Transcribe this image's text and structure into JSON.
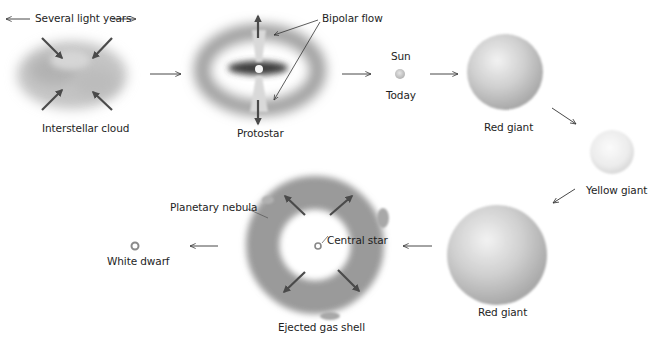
{
  "diagram": {
    "scale_label": "Several light years",
    "stages": [
      {
        "id": "interstellar-cloud",
        "label": "Interstellar cloud"
      },
      {
        "id": "protostar",
        "label": "Protostar",
        "annotation": "Bipolar flow"
      },
      {
        "id": "sun",
        "label_top": "Sun",
        "label_bottom": "Today"
      },
      {
        "id": "red-giant-1",
        "label": "Red giant"
      },
      {
        "id": "yellow-giant",
        "label": "Yellow giant"
      },
      {
        "id": "red-giant-2",
        "label": "Red giant"
      },
      {
        "id": "planetary-nebula",
        "label": "Ejected gas shell",
        "annotations": [
          "Planetary nebula",
          "Central star"
        ]
      },
      {
        "id": "white-dwarf",
        "label": "White dwarf"
      }
    ],
    "flow_order": [
      "Interstellar cloud",
      "Protostar",
      "Sun (Today)",
      "Red giant",
      "Yellow giant",
      "Red giant",
      "Ejected gas shell",
      "White dwarf"
    ],
    "colors": {
      "ink": "#333333",
      "cloud": "#b8b8b8",
      "giant": "#c9c9c9",
      "yellow_giant": "#ececec"
    }
  }
}
